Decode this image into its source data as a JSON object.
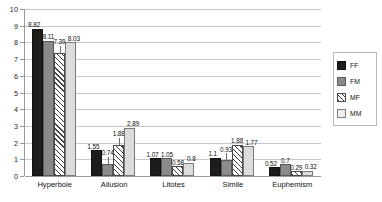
{
  "chart_data": {
    "type": "bar",
    "title": "",
    "subtitle": "",
    "xlabel": "",
    "ylabel": "",
    "ylim": [
      0,
      10
    ],
    "ytick_step": 1,
    "yticks": [
      "10",
      "9",
      "8",
      "7",
      "6",
      "5",
      "4",
      "3",
      "2",
      "1",
      "0"
    ],
    "grid": true,
    "legend_position": "right",
    "categories": [
      "Hyperbole",
      "Allusion",
      "Litotes",
      "Simile",
      "Euphemism"
    ],
    "series": [
      {
        "name": "FF",
        "values": [
          8.82,
          1.55,
          1.07,
          1.1,
          0.52
        ]
      },
      {
        "name": "FM",
        "values": [
          8.11,
          0.74,
          1.05,
          0.93,
          0.7
        ]
      },
      {
        "name": "MF",
        "values": [
          7.39,
          1.88,
          0.58,
          1.88,
          0.29
        ]
      },
      {
        "name": "MM",
        "values": [
          8.03,
          2.89,
          0.8,
          1.77,
          0.32
        ]
      }
    ],
    "data_labels": [
      [
        "8.82",
        "8.11",
        "7.39",
        "8.03"
      ],
      [
        "1.55",
        "0.74",
        "1.88",
        "2.89"
      ],
      [
        "1.07",
        "1.05",
        "0.58",
        "0.8"
      ],
      [
        "1.1",
        "0.93",
        "1.88",
        "1.77"
      ],
      [
        "0.52",
        "0.7",
        "0.29",
        "0.32"
      ]
    ]
  },
  "legend": {
    "items": [
      {
        "label": "FF"
      },
      {
        "label": "FM"
      },
      {
        "label": "MF"
      },
      {
        "label": "MM"
      }
    ]
  }
}
